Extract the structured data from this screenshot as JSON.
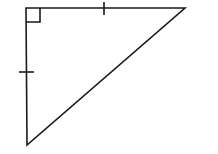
{
  "diagram": {
    "type": "right-isosceles-triangle",
    "stroke_color": "#1a1a1a",
    "background": "#ffffff",
    "vertices": {
      "right_angle": [
        26,
        8
      ],
      "top_right": [
        185,
        8
      ],
      "bottom_left": [
        27,
        145
      ]
    },
    "right_angle_marker": {
      "size": 14
    },
    "congruence_ticks": [
      {
        "side": "top",
        "position": [
          104,
          8
        ],
        "count": 1
      },
      {
        "side": "left",
        "position": [
          26,
          72
        ],
        "count": 1
      }
    ]
  }
}
